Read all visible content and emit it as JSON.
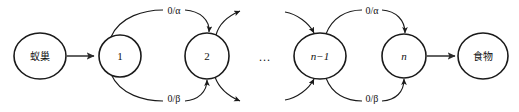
{
  "diagram": {
    "type": "state-transition-graph",
    "title": "",
    "background_color": "#ffffff",
    "stroke_color": "#1a1a1a",
    "nodes": [
      {
        "id": "nest",
        "label": "蚁巢",
        "cx": 40,
        "cy": 56,
        "rx": 26,
        "ry": 23,
        "style": "cjk"
      },
      {
        "id": "n1",
        "label": "1",
        "cx": 120,
        "cy": 56,
        "rx": 21,
        "ry": 21,
        "style": "roman"
      },
      {
        "id": "n2",
        "label": "2",
        "cx": 207,
        "cy": 56,
        "rx": 22,
        "ry": 23,
        "style": "roman"
      },
      {
        "id": "nm1",
        "label": "n−1",
        "cx": 320,
        "cy": 56,
        "rx": 26,
        "ry": 23,
        "style": "italic"
      },
      {
        "id": "nn",
        "label": "n",
        "cx": 404,
        "cy": 56,
        "rx": 22,
        "ry": 22,
        "style": "italic"
      },
      {
        "id": "food",
        "label": "食物",
        "cx": 483,
        "cy": 56,
        "rx": 25,
        "ry": 23,
        "style": "cjk"
      }
    ],
    "ellipsis": {
      "label": "...",
      "x": 265,
      "y": 58
    },
    "edge_labels": {
      "alpha_left": {
        "text": "0/α",
        "x": 163,
        "y": 13
      },
      "beta_left": {
        "text": "0/β",
        "x": 163,
        "y": 99
      },
      "alpha_right": {
        "text": "0/α",
        "x": 362,
        "y": 13
      },
      "beta_right": {
        "text": "0/β",
        "x": 362,
        "y": 99
      }
    },
    "edges": [
      {
        "id": "nest-to-1",
        "from": "nest",
        "to": "n1",
        "shape": "straight",
        "label": ""
      },
      {
        "id": "1-to-2-top",
        "from": "n1",
        "to": "n2",
        "shape": "arc-above",
        "label": "0/α"
      },
      {
        "id": "1-to-2-bot",
        "from": "n1",
        "to": "n2",
        "shape": "arc-below",
        "label": "0/β"
      },
      {
        "id": "2-out-top",
        "from": "n2",
        "to": "",
        "shape": "arc-out-upper-right",
        "label": ""
      },
      {
        "id": "2-out-bot",
        "from": "n2",
        "to": "",
        "shape": "arc-out-lower-right",
        "label": ""
      },
      {
        "id": "in-nm1-top",
        "from": "",
        "to": "nm1",
        "shape": "arc-in-upper-left",
        "label": ""
      },
      {
        "id": "in-nm1-bot",
        "from": "",
        "to": "nm1",
        "shape": "arc-in-lower-left",
        "label": ""
      },
      {
        "id": "nm1-to-n-top",
        "from": "nm1",
        "to": "nn",
        "shape": "arc-above",
        "label": "0/α"
      },
      {
        "id": "nm1-to-n-bot",
        "from": "nm1",
        "to": "nn",
        "shape": "arc-below",
        "label": "0/β"
      },
      {
        "id": "n-to-food",
        "from": "nn",
        "to": "food",
        "shape": "straight",
        "label": ""
      }
    ]
  }
}
